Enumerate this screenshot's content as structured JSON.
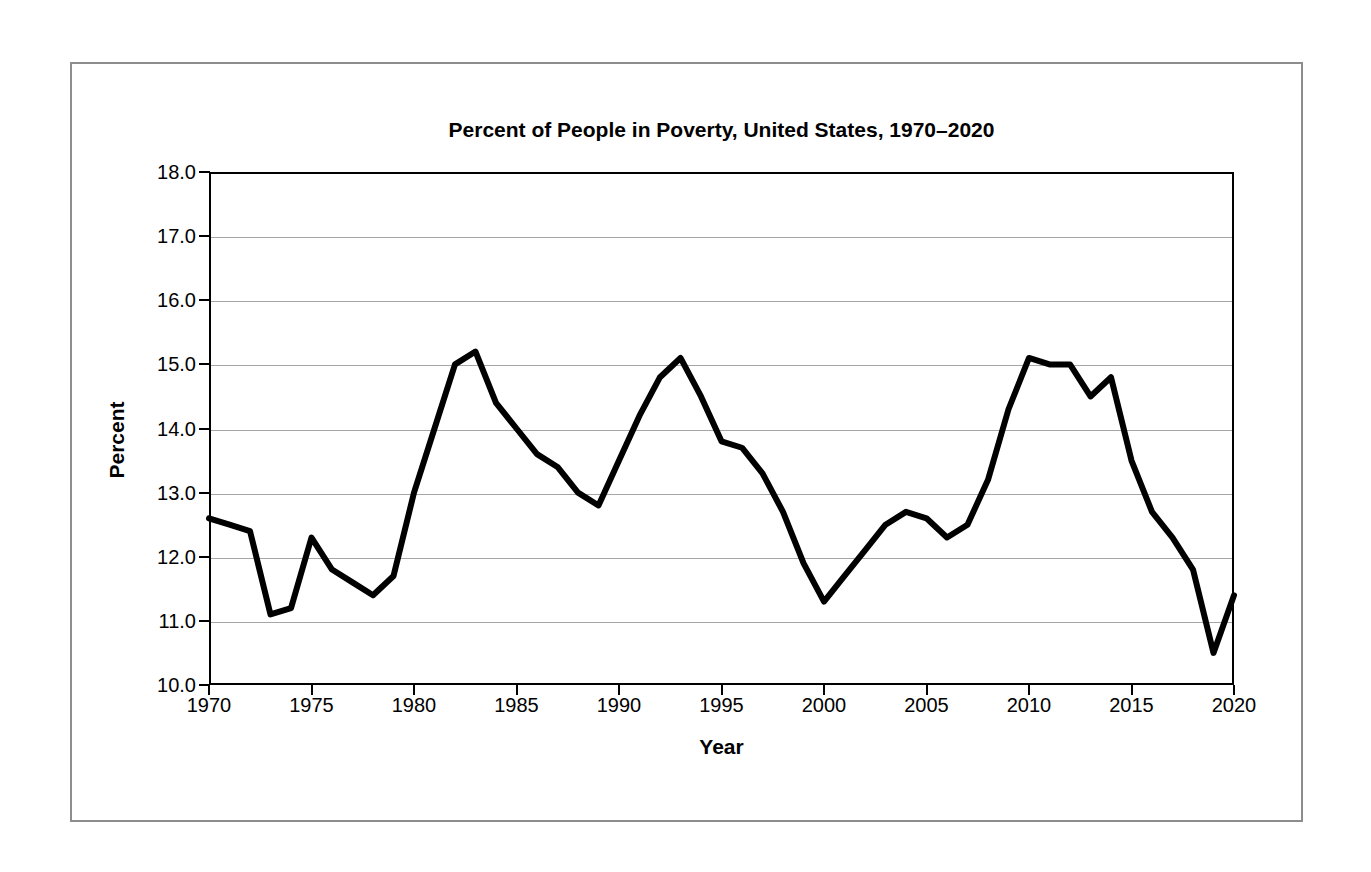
{
  "figure": {
    "title": "Percent of People in Poverty, United States, 1970–2020",
    "line_color": "#000000",
    "grid_color": "#a6a6a6",
    "axis_color": "#000000",
    "frame_color": "#8d8d8d"
  },
  "axes": {
    "y_title": "Percent",
    "x_title": "Year",
    "y_tick_labels": [
      "18.0",
      "17.0",
      "16.0",
      "15.0",
      "14.0",
      "13.0",
      "12.0",
      "11.0",
      "10.0"
    ],
    "x_tick_labels": [
      "1970",
      "1975",
      "1980",
      "1985",
      "1990",
      "1995",
      "2000",
      "2005",
      "2010",
      "2015",
      "2020"
    ]
  },
  "chart_data": {
    "type": "line",
    "title": "Percent of People in Poverty, United States, 1970–2020",
    "xlabel": "Year",
    "ylabel": "Percent",
    "xlim": [
      1970,
      2020
    ],
    "ylim": [
      10.0,
      18.0
    ],
    "ytick_step": 1.0,
    "xtick_step": 5,
    "grid": "horizontal",
    "legend": "none",
    "x": [
      1970,
      1971,
      1972,
      1973,
      1974,
      1975,
      1976,
      1977,
      1978,
      1979,
      1980,
      1981,
      1982,
      1983,
      1984,
      1985,
      1986,
      1987,
      1988,
      1989,
      1990,
      1991,
      1992,
      1993,
      1994,
      1995,
      1996,
      1997,
      1998,
      1999,
      2000,
      2001,
      2002,
      2003,
      2004,
      2005,
      2006,
      2007,
      2008,
      2009,
      2010,
      2011,
      2012,
      2013,
      2014,
      2015,
      2016,
      2017,
      2018,
      2019,
      2020
    ],
    "values": [
      12.6,
      12.5,
      12.4,
      11.1,
      11.2,
      12.3,
      11.8,
      11.6,
      11.4,
      11.7,
      13.0,
      14.0,
      15.0,
      15.2,
      14.4,
      14.0,
      13.6,
      13.4,
      13.0,
      12.8,
      13.5,
      14.2,
      14.8,
      15.1,
      14.5,
      13.8,
      13.7,
      13.3,
      12.7,
      11.9,
      11.3,
      11.7,
      12.1,
      12.5,
      12.7,
      12.6,
      12.3,
      12.5,
      13.2,
      14.3,
      15.1,
      15.0,
      15.0,
      14.5,
      14.8,
      13.5,
      12.7,
      12.3,
      11.8,
      10.5,
      11.4
    ],
    "series": [
      {
        "name": "Percent of people in poverty",
        "values": [
          12.6,
          12.5,
          12.4,
          11.1,
          11.2,
          12.3,
          11.8,
          11.6,
          11.4,
          11.7,
          13.0,
          14.0,
          15.0,
          15.2,
          14.4,
          14.0,
          13.6,
          13.4,
          13.0,
          12.8,
          13.5,
          14.2,
          14.8,
          15.1,
          14.5,
          13.8,
          13.7,
          13.3,
          12.7,
          11.9,
          11.3,
          11.7,
          12.1,
          12.5,
          12.7,
          12.6,
          12.3,
          12.5,
          13.2,
          14.3,
          15.1,
          15.0,
          15.0,
          14.5,
          14.8,
          13.5,
          12.7,
          12.3,
          11.8,
          10.5,
          11.4
        ]
      }
    ]
  }
}
